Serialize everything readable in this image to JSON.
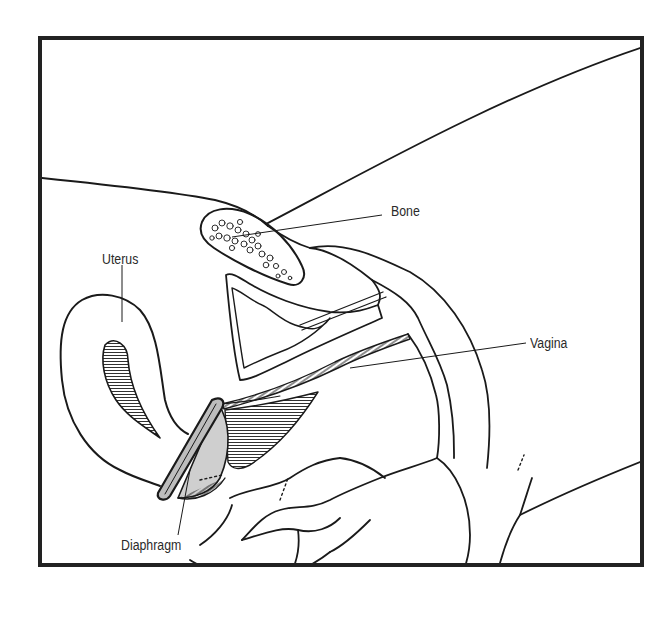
{
  "figure": {
    "type": "anatomical-cross-section",
    "colors": {
      "ink": "#1a1a1a",
      "frame": "#222222",
      "diaphragm_fill": "#cfcfcf",
      "background": "#ffffff"
    },
    "labels": [
      {
        "id": "bone",
        "text": "Bone"
      },
      {
        "id": "uterus",
        "text": "Uterus"
      },
      {
        "id": "vagina",
        "text": "Vagina"
      },
      {
        "id": "diaphragm",
        "text": "Diaphragm"
      }
    ]
  }
}
